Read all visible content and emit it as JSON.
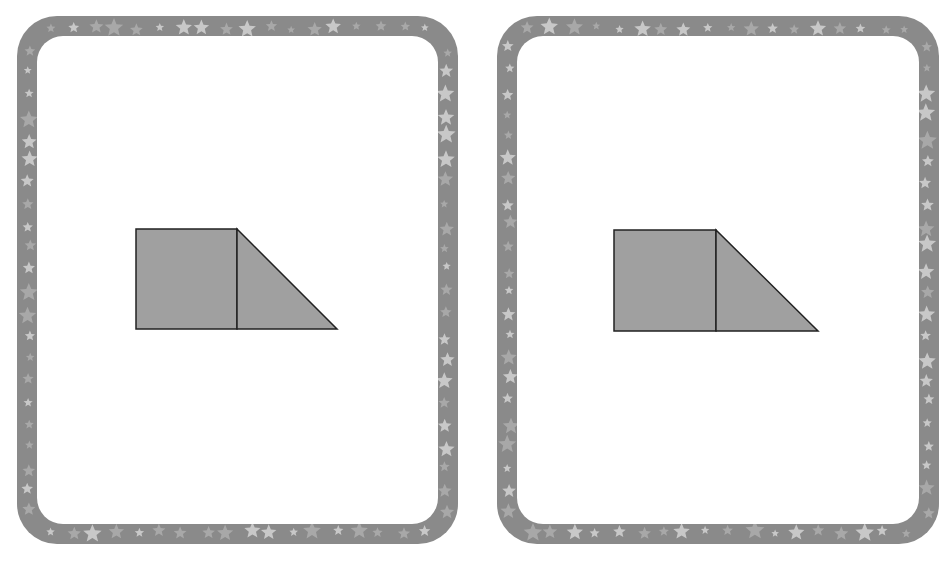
{
  "cards": [
    {
      "name": "left-card",
      "frame": {
        "x": 17,
        "y": 16,
        "w": 441,
        "h": 528
      },
      "border_color": "#8a8a8a",
      "star_color": "#bdbdbd",
      "figure": {
        "square": {
          "x": 136,
          "y": 229,
          "size": 101
        },
        "triangle_right_x": 337,
        "fill": "#a0a0a0",
        "stroke": "#222222"
      }
    },
    {
      "name": "right-card",
      "frame": {
        "x": 497,
        "y": 16,
        "w": 442,
        "h": 528
      },
      "border_color": "#8a8a8a",
      "star_color": "#bdbdbd",
      "figure": {
        "square": {
          "x": 614,
          "y": 230,
          "size": 102
        },
        "triangle_right_x": 818,
        "fill": "#a0a0a0",
        "stroke": "#222222"
      }
    }
  ]
}
